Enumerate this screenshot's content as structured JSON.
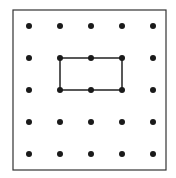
{
  "diagram": {
    "type": "geoboard",
    "frame": {
      "x": 13,
      "y": 10,
      "width": 153,
      "height": 160,
      "stroke": "#333333"
    },
    "grid": {
      "rows": 5,
      "cols": 5,
      "x": [
        29,
        60,
        91,
        122,
        153
      ],
      "y": [
        26,
        58,
        90,
        122,
        154
      ],
      "dot_radius": 3,
      "dot_color": "#1a1a1a"
    },
    "shape": {
      "type": "rectangle",
      "vertices_grid": [
        [
          1,
          1
        ],
        [
          3,
          1
        ],
        [
          3,
          2
        ],
        [
          1,
          2
        ]
      ],
      "stroke": "#222222",
      "width_units": 2,
      "height_units": 1
    }
  }
}
